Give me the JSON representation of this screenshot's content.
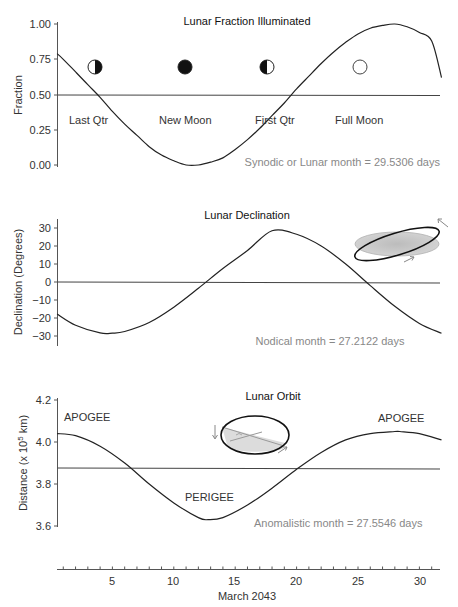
{
  "figure": {
    "xaxis": {
      "label": "March 2043",
      "ticks": [
        5,
        10,
        15,
        20,
        25,
        30
      ],
      "tick_labels": [
        "5",
        "10",
        "15",
        "20",
        "25",
        "30"
      ],
      "range": [
        0.5,
        31.8
      ]
    },
    "panels": {
      "fraction": {
        "title": "Lunar Fraction Illuminated",
        "ylabel": "Fraction",
        "yticks": [
          "0.00",
          "0.25",
          "0.50",
          "0.75",
          "1.00"
        ],
        "phase_labels": [
          "Last Qtr",
          "New Moon",
          "First Qtr",
          "Full Moon"
        ],
        "note": "Synodic or Lunar month = 29.5306 days"
      },
      "declination": {
        "title": "Lunar Declination",
        "ylabel": "Declination (Degrees)",
        "yticks": [
          "−30",
          "−20",
          "−10",
          "0",
          "10",
          "20",
          "30"
        ],
        "note": "Nodical month = 27.2122 days"
      },
      "distance": {
        "title": "Lunar Orbit",
        "ylabel_main": "Distance (x 10",
        "ylabel_sup": "5",
        "ylabel_end": " km)",
        "yticks": [
          "3.6",
          "3.8",
          "4.0",
          "4.2"
        ],
        "apogee_label": "APOGEE",
        "perigee_label": "PERIGEE",
        "note": "Anomalistic month = 27.5546 days"
      }
    },
    "colors": {
      "curve": "#222222",
      "note_text": "#888888",
      "orbit_plane": "#c8c8c8"
    }
  },
  "chart_data": [
    {
      "type": "line",
      "title": "Lunar Fraction Illuminated",
      "xlabel": "March 2043",
      "ylabel": "Fraction",
      "ylim": [
        0,
        1
      ],
      "yticks": [
        0,
        0.25,
        0.5,
        0.75,
        1.0
      ],
      "xlim": [
        0.5,
        31.8
      ],
      "reference_line": 0.5,
      "annotations": [
        {
          "text": "Last Qtr",
          "day": 3.5,
          "icon": "last-quarter-moon"
        },
        {
          "text": "New Moon",
          "day": 10.9,
          "icon": "new-moon"
        },
        {
          "text": "First Qtr",
          "day": 17.6,
          "icon": "first-quarter-moon"
        },
        {
          "text": "Full Moon",
          "day": 25.2,
          "icon": "full-moon"
        },
        {
          "text": "Synodic or Lunar month = 29.5306 days"
        }
      ],
      "series": [
        {
          "name": "Fraction illuminated",
          "x": [
            0.5,
            1,
            2,
            3,
            4,
            5,
            6,
            7,
            8,
            9,
            10,
            11,
            12,
            13,
            14,
            15,
            16,
            17,
            18,
            19,
            20,
            21,
            22,
            23,
            24,
            25,
            26,
            27,
            28,
            29,
            30,
            31,
            31.8
          ],
          "values": [
            0.79,
            0.75,
            0.66,
            0.57,
            0.48,
            0.38,
            0.29,
            0.21,
            0.13,
            0.07,
            0.03,
            0.0,
            0.0,
            0.02,
            0.05,
            0.11,
            0.18,
            0.26,
            0.35,
            0.44,
            0.54,
            0.63,
            0.72,
            0.8,
            0.87,
            0.93,
            0.97,
            0.99,
            1.0,
            0.98,
            0.94,
            0.88,
            0.62
          ]
        }
      ]
    },
    {
      "type": "line",
      "title": "Lunar Declination",
      "xlabel": "March 2043",
      "ylabel": "Declination (Degrees)",
      "ylim": [
        -35,
        35
      ],
      "yticks": [
        -30,
        -20,
        -10,
        0,
        10,
        20,
        30
      ],
      "xlim": [
        0.5,
        31.8
      ],
      "reference_line": 0,
      "annotations": [
        {
          "text": "Nodical month = 27.2122 days"
        }
      ],
      "series": [
        {
          "name": "Declination",
          "x": [
            0.5,
            2,
            4,
            5,
            6,
            8,
            10,
            12,
            14,
            16,
            18,
            20,
            22,
            24,
            26,
            28,
            30,
            31.8
          ],
          "values": [
            -17.8,
            -24.0,
            -28.3,
            -28.4,
            -27.5,
            -22.5,
            -14.0,
            -3.5,
            7.5,
            17.5,
            28.5,
            26.5,
            20.0,
            10.0,
            -2.0,
            -13.5,
            -23.0,
            -28.5
          ]
        }
      ]
    },
    {
      "type": "line",
      "title": "Lunar Orbit",
      "xlabel": "March 2043",
      "ylabel": "Distance (x 10^5 km)",
      "ylim": [
        3.6,
        4.2
      ],
      "yticks": [
        3.6,
        3.8,
        4.0,
        4.2
      ],
      "xlim": [
        0.5,
        31.8
      ],
      "reference_line": 3.875,
      "annotations": [
        {
          "text": "APOGEE",
          "day": 0.5
        },
        {
          "text": "PERIGEE",
          "day": 12.8
        },
        {
          "text": "APOGEE",
          "day": 28.4
        },
        {
          "text": "Anomalistic month = 27.5546 days"
        }
      ],
      "series": [
        {
          "name": "Earth-Moon distance",
          "x": [
            0.5,
            2,
            4,
            6,
            8,
            10,
            12,
            12.8,
            14,
            16,
            18,
            20,
            22,
            24,
            26,
            28,
            28.4,
            30,
            31.8
          ],
          "values": [
            4.04,
            4.03,
            3.98,
            3.9,
            3.8,
            3.71,
            3.64,
            3.63,
            3.64,
            3.7,
            3.78,
            3.87,
            3.95,
            4.01,
            4.04,
            4.05,
            4.05,
            4.04,
            4.01
          ]
        }
      ]
    }
  ]
}
